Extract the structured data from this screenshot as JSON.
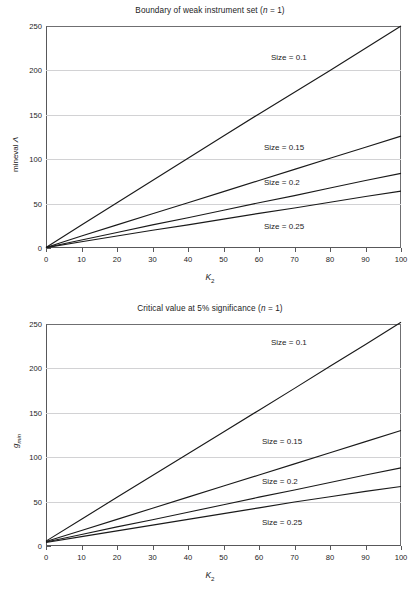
{
  "figure": {
    "width": 420,
    "height": 597,
    "background": "#ffffff",
    "line_color": "#1a1a1a",
    "grid_color": "#d2d2d4",
    "axis_color": "#58585a"
  },
  "charts": [
    {
      "id": "boundary-weak-instrument-set",
      "title_prefix": "Boundary of weak instrument set (",
      "title_italic": "n",
      "title_suffix": " = 1)",
      "ylabel_text": "mineval ",
      "ylabel_symbol": "Λ",
      "xlabel_main": "K",
      "xlabel_sub": "2",
      "ylim": [
        0,
        250
      ],
      "xlim": [
        0,
        100
      ],
      "yticks": [
        0,
        50,
        100,
        150,
        200,
        250
      ],
      "yticks_minor": [
        10,
        20,
        30,
        40,
        60,
        70,
        80,
        90,
        110,
        120,
        130,
        140,
        160,
        170,
        180,
        190,
        210,
        220,
        230,
        240
      ],
      "xticks": [
        0,
        10,
        20,
        30,
        40,
        50,
        60,
        70,
        80,
        90,
        100
      ],
      "grid": true,
      "series_labels": [
        {
          "text": "Size = 0.1",
          "x_px": 271,
          "y_px": 53
        },
        {
          "text": "Size = 0.15",
          "x_px": 264,
          "y_px": 143
        },
        {
          "text": "Size = 0.2",
          "x_px": 264,
          "y_px": 178
        },
        {
          "text": "Size = 0.25",
          "x_px": 264,
          "y_px": 222
        }
      ]
    },
    {
      "id": "critical-value-5pct-significance",
      "title_prefix": "Critical value at 5% significance (",
      "title_italic": "n",
      "title_suffix": " = 1)",
      "ylabel_text": "",
      "ylabel_symbol": "g",
      "ylabel_sub": "min",
      "xlabel_main": "K",
      "xlabel_sub": "2",
      "ylim": [
        0,
        250
      ],
      "xlim": [
        0,
        100
      ],
      "yticks": [
        0,
        50,
        100,
        150,
        200,
        250
      ],
      "yticks_minor": [
        10,
        20,
        30,
        40,
        60,
        70,
        80,
        90,
        110,
        120,
        130,
        140,
        160,
        170,
        180,
        190,
        210,
        220,
        230,
        240
      ],
      "xticks": [
        0,
        10,
        20,
        30,
        40,
        50,
        60,
        70,
        80,
        90,
        100
      ],
      "grid": true,
      "series_labels": [
        {
          "text": "Size = 0.1",
          "x_px": 271,
          "y_px": 338
        },
        {
          "text": "Size = 0.15",
          "x_px": 262,
          "y_px": 437
        },
        {
          "text": "Size = 0.2",
          "x_px": 262,
          "y_px": 477
        },
        {
          "text": "Size = 0.25",
          "x_px": 262,
          "y_px": 518
        }
      ]
    }
  ],
  "chart_data": [
    {
      "type": "line",
      "title": "Boundary of weak instrument set (n = 1)",
      "xlabel": "K2",
      "ylabel": "mineval Λ",
      "xlim": [
        0,
        100
      ],
      "ylim": [
        0,
        250
      ],
      "xticks": [
        0,
        10,
        20,
        30,
        40,
        50,
        60,
        70,
        80,
        90,
        100
      ],
      "yticks": [
        0,
        50,
        100,
        150,
        200,
        250
      ],
      "grid": true,
      "legend": "inline-annotations",
      "x": [
        0,
        10,
        20,
        30,
        40,
        50,
        60,
        70,
        80,
        90,
        100
      ],
      "series": [
        {
          "name": "Size = 0.1",
          "values": [
            0.5,
            26.0,
            51.0,
            76.0,
            101.0,
            126.0,
            151.0,
            175.5,
            200.0,
            225.0,
            250.0
          ]
        },
        {
          "name": "Size = 0.15",
          "values": [
            0.5,
            13.5,
            26.0,
            38.5,
            51.0,
            63.5,
            76.0,
            88.5,
            101.0,
            113.5,
            126.0
          ]
        },
        {
          "name": "Size = 0.2",
          "values": [
            0.5,
            9.0,
            17.5,
            26.0,
            34.0,
            42.5,
            51.0,
            59.0,
            67.5,
            76.0,
            84.0
          ]
        },
        {
          "name": "Size = 0.25",
          "values": [
            0.5,
            7.0,
            13.5,
            20.0,
            26.0,
            32.5,
            39.0,
            45.0,
            51.5,
            58.0,
            64.0
          ]
        }
      ]
    },
    {
      "type": "line",
      "title": "Critical value at 5% significance (n = 1)",
      "xlabel": "K2",
      "ylabel": "g_min",
      "xlim": [
        0,
        100
      ],
      "ylim": [
        0,
        250
      ],
      "xticks": [
        0,
        10,
        20,
        30,
        40,
        50,
        60,
        70,
        80,
        90,
        100
      ],
      "yticks": [
        0,
        50,
        100,
        150,
        200,
        250
      ],
      "grid": true,
      "legend": "inline-annotations",
      "x": [
        0,
        10,
        20,
        30,
        40,
        50,
        60,
        70,
        80,
        90,
        100
      ],
      "series": [
        {
          "name": "Size = 0.1",
          "values": [
            5.5,
            30.0,
            55.0,
            79.5,
            104.0,
            128.5,
            153.0,
            177.5,
            202.5,
            227.0,
            252.0
          ]
        },
        {
          "name": "Size = 0.15",
          "values": [
            5.0,
            17.5,
            30.0,
            42.5,
            55.0,
            67.5,
            80.0,
            92.5,
            105.0,
            117.5,
            130.0
          ]
        },
        {
          "name": "Size = 0.2",
          "values": [
            4.5,
            13.0,
            21.5,
            29.5,
            38.0,
            46.5,
            55.0,
            63.0,
            71.5,
            80.0,
            88.0
          ]
        },
        {
          "name": "Size = 0.25",
          "values": [
            4.0,
            10.5,
            17.0,
            23.5,
            30.0,
            36.5,
            43.0,
            49.5,
            55.5,
            61.5,
            67.0
          ]
        }
      ]
    }
  ]
}
